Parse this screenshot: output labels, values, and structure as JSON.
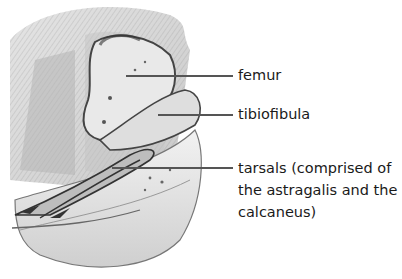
{
  "figure": {
    "labels": [
      {
        "id": "femur",
        "text": "femur"
      },
      {
        "id": "tibiofibula",
        "text": "tibiofibula"
      },
      {
        "id": "tarsals",
        "text": "tarsals (comprised of\nthe astragalis and the\ncalcaneus)"
      }
    ],
    "colors": {
      "line": "#555555",
      "text": "#1a1a1a",
      "sketch_dark": "#3a3a3a",
      "sketch_mid": "#8a8a8a",
      "sketch_light": "#d8d8d8"
    }
  }
}
